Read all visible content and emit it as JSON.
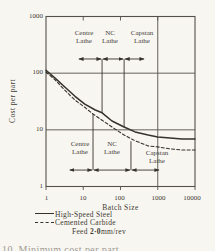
{
  "figure": {
    "y_axis_title": "Cost per part",
    "x_axis_title": "Batch Size",
    "y_tick_labels": [
      "1000",
      "100",
      "10",
      "1"
    ],
    "x_tick_labels": [
      "1",
      "10",
      "100",
      "1000",
      "10000"
    ],
    "legend": [
      {
        "style": "solid",
        "label": "High-Speed Steel"
      },
      {
        "style": "dashed",
        "label": "Cemented  Carbide"
      }
    ],
    "feed_label": "Feed",
    "feed_value": "2·0",
    "feed_unit": "mm/rev",
    "caption_fragment": "10. Minimum cost per part"
  },
  "chart_data": {
    "type": "line",
    "title": "",
    "xlabel": "Batch Size",
    "ylabel": "Cost per part",
    "x_scale": "log",
    "y_scale": "log",
    "xlim": [
      1,
      10000
    ],
    "ylim": [
      1,
      1000
    ],
    "gridlines": {
      "y": [
        100,
        10
      ],
      "x": [
        1000
      ]
    },
    "top_axis_ticks": [
      10,
      100,
      1000
    ],
    "bottom_axis_ticks": [
      1,
      10,
      100,
      1000,
      10000
    ],
    "machines": [
      {
        "line1": "Centre",
        "line2": "Lathe"
      },
      {
        "line1": "NC",
        "line2": "Lathe"
      },
      {
        "line1": "Capstan",
        "line2": "Lathe"
      }
    ],
    "series": [
      {
        "name": "High-Speed Steel",
        "style": "solid",
        "points": [
          [
            1,
            113
          ],
          [
            1.75,
            82
          ],
          [
            3.2,
            57
          ],
          [
            6,
            39
          ],
          [
            11,
            28.5
          ],
          [
            21,
            22.4
          ],
          [
            32,
            20
          ],
          [
            59,
            14.3
          ],
          [
            125,
            11.2
          ],
          [
            246,
            9.2
          ],
          [
            550,
            8.1
          ],
          [
            1000,
            7.5
          ],
          [
            2140,
            7.2
          ],
          [
            4500,
            6.9
          ],
          [
            10000,
            6.9
          ]
        ]
      },
      {
        "name": "Cemented Carbide",
        "style": "dashed",
        "points": [
          [
            1,
            105
          ],
          [
            1.75,
            76
          ],
          [
            3.2,
            50
          ],
          [
            6,
            33.5
          ],
          [
            11,
            25
          ],
          [
            18.3,
            19
          ],
          [
            32,
            14.8
          ],
          [
            59,
            11.2
          ],
          [
            125,
            8.1
          ],
          [
            246,
            6.4
          ],
          [
            550,
            5.2
          ],
          [
            1000,
            5.0
          ],
          [
            2140,
            4.6
          ],
          [
            4500,
            4.4
          ],
          [
            10000,
            4.4
          ]
        ]
      }
    ],
    "annotations": [
      {
        "applies_to": "High-Speed Steel",
        "row_cost": 178,
        "span": [
          7.2,
          455
        ],
        "boundaries": [
          32,
          125
        ],
        "boundary_curve_costs": [
          20,
          11.2
        ]
      },
      {
        "applies_to": "Cemented Carbide",
        "row_cost": 1.95,
        "span": [
          4.1,
          1150
        ],
        "boundaries": [
          18.3,
          191
        ],
        "boundary_curve_costs": [
          19,
          6.3
        ]
      }
    ],
    "ink_color": "#35312b",
    "frame_color": "#55504a"
  }
}
